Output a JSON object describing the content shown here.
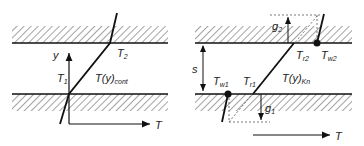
{
  "left_panel": {
    "labels": {
      "y_axis": "y",
      "x_axis": "T",
      "t1_main": "T",
      "t1_sub": "1",
      "t2_main": "T",
      "t2_sub": "2",
      "profile_main": "T(y)",
      "profile_sub": "cont"
    }
  },
  "right_panel": {
    "labels": {
      "gap": "s",
      "x_axis": "T",
      "tw1_main": "T",
      "tw1_sub": "w1",
      "tw2_main": "T",
      "tw2_sub": "w2",
      "tr1_main": "T",
      "tr1_sub": "r1",
      "tr2_main": "T",
      "tr2_sub": "r2",
      "profile_main": "T(y)",
      "profile_sub": "Kn",
      "g1_main": "g",
      "g1_sub": "1",
      "g2_main": "g",
      "g2_sub": "2"
    }
  },
  "colors": {
    "line": "#111111",
    "hatch": "#444444",
    "dashed": "#555555"
  }
}
